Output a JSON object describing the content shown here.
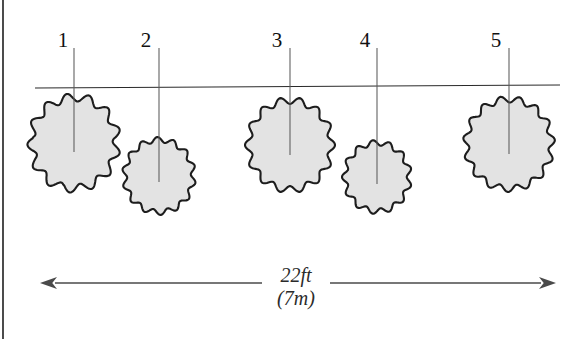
{
  "figure": {
    "kind": "plan-view-tree-spacing-diagram",
    "background_color": "#ffffff",
    "canopy_fill_color": "#e3e3e3",
    "canopy_outline_color": "#1d1d1d",
    "stem_line_color": "#5a5a5a",
    "ground_line_color": "#2a2a2a",
    "dimension_color": "#4a4a4a",
    "label_color": "#111111"
  },
  "frame": {
    "left_rule": {
      "x": 3,
      "y1": 0,
      "y2": 339
    }
  },
  "reference_line": {
    "name": "alignment-line",
    "x1": 35,
    "y1": 88,
    "x2": 560,
    "y2": 85
  },
  "trees": [
    {
      "label": "1",
      "label_x": 63,
      "label_y": 47,
      "stem_x": 74,
      "stem_top_y": 48,
      "stem_bottom_y": 152,
      "cx": 74,
      "cy": 143,
      "rx": 47,
      "ry": 50,
      "bumps": 13,
      "bump_depth": 0.085,
      "phase": 0.32,
      "irregular": true,
      "touches_reference_line": true
    },
    {
      "label": "2",
      "label_x": 146,
      "label_y": 47,
      "stem_x": 159,
      "stem_top_y": 48,
      "stem_bottom_y": 182,
      "cx": 159,
      "cy": 176,
      "rx": 37,
      "ry": 39,
      "bumps": 14,
      "bump_depth": 0.07,
      "phase": 0.1,
      "irregular": false,
      "touches_reference_line": false
    },
    {
      "label": "3",
      "label_x": 277,
      "label_y": 47,
      "stem_x": 290,
      "stem_top_y": 48,
      "stem_bottom_y": 155,
      "cx": 290,
      "cy": 145,
      "rx": 45,
      "ry": 48,
      "bumps": 14,
      "bump_depth": 0.072,
      "phase": 0.5,
      "irregular": false,
      "touches_reference_line": true
    },
    {
      "label": "4",
      "label_x": 365,
      "label_y": 47,
      "stem_x": 377,
      "stem_top_y": 48,
      "stem_bottom_y": 184,
      "cx": 377,
      "cy": 177,
      "rx": 35,
      "ry": 37,
      "bumps": 13,
      "bump_depth": 0.075,
      "phase": 0.25,
      "irregular": false,
      "touches_reference_line": false
    },
    {
      "label": "5",
      "label_x": 496,
      "label_y": 47,
      "stem_x": 509,
      "stem_top_y": 48,
      "stem_bottom_y": 154,
      "cx": 509,
      "cy": 144,
      "rx": 46,
      "ry": 48,
      "bumps": 15,
      "bump_depth": 0.068,
      "phase": 0.45,
      "irregular": false,
      "touches_reference_line": true
    }
  ],
  "dimension": {
    "name": "overall-width",
    "y": 283,
    "x_start": 40,
    "x_end": 556,
    "gap_start": 262,
    "gap_end": 330,
    "arrowhead_length": 17,
    "arrowhead_halfwidth": 6,
    "value_imperial": "22ft",
    "value_metric": "(7m)",
    "value_imperial_x": 296,
    "value_imperial_y": 282,
    "value_metric_x": 296,
    "value_metric_y": 305
  }
}
